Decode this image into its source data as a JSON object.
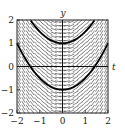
{
  "chart_data": {
    "type": "slope_field",
    "title": "",
    "xlabel": "t",
    "ylabel": "y",
    "differential_equation": "dy/dt = t",
    "xlim": [
      -2,
      2
    ],
    "ylim": [
      -2,
      2
    ],
    "xticks": [
      -2,
      -1,
      0,
      1,
      2
    ],
    "yticks": [
      -2,
      -1,
      0,
      1,
      2
    ],
    "xtick_labels": [
      "−2",
      "−1",
      "0",
      "1",
      "2"
    ],
    "ytick_labels": [
      "−2",
      "−1",
      "0",
      "1",
      "2"
    ],
    "field_grid": {
      "nx": 21,
      "ny": 25
    },
    "series": [
      {
        "name": "solution y(0)=1",
        "formula": "y = t^2/2 + 1",
        "y0": 1
      },
      {
        "name": "solution y(0)=-1",
        "formula": "y = t^2/2 - 1",
        "y0": -1
      }
    ],
    "grid": false,
    "legend": "none"
  }
}
